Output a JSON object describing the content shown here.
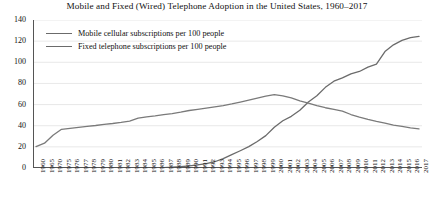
{
  "chart_data": {
    "type": "line",
    "title": "Mobile and Fixed (Wired) Telephone Adoption in the United States, 1960–2017",
    "xlabel": "",
    "ylabel": "",
    "ylim": [
      0,
      140
    ],
    "ytick_step": 20,
    "yticks": [
      0,
      20,
      40,
      60,
      80,
      100,
      120,
      140
    ],
    "grid": true,
    "legend_position": "top-left",
    "legend": [
      "Mobile cellular subscriptions per 100 people",
      "Fixed telephone subscriptions per 100 people"
    ],
    "categories": [
      "1960",
      "1965",
      "1970",
      "1975",
      "1976",
      "1977",
      "1978",
      "1979",
      "1980",
      "1981",
      "1982",
      "1983",
      "1984",
      "1985",
      "1986",
      "1987",
      "1988",
      "1989",
      "1990",
      "1991",
      "1992",
      "1993",
      "1994",
      "1995",
      "1996",
      "1997",
      "1998",
      "1999",
      "2000",
      "2001",
      "2002",
      "2003",
      "2004",
      "2005",
      "2006",
      "2007",
      "2008",
      "2009",
      "2010",
      "2011",
      "2012",
      "2013",
      "2014",
      "2015",
      "2016",
      "2017"
    ],
    "series": [
      {
        "name": "Mobile cellular subscriptions per 100 people",
        "color": "#6b6b6b",
        "values": [
          0,
          0,
          0,
          0,
          0,
          0,
          0,
          0,
          0,
          0,
          0,
          0,
          0,
          0,
          0.1,
          0.4,
          0.7,
          1.2,
          2.1,
          3.0,
          4.2,
          5.9,
          8.8,
          12.6,
          16.3,
          20.2,
          25.1,
          30.6,
          38.5,
          44.7,
          48.9,
          54.6,
          62.5,
          68.3,
          76.3,
          82.1,
          85.2,
          89.1,
          91.3,
          95.4,
          98.2,
          110.1,
          116.5,
          120.7,
          123.3,
          124.5
        ]
      },
      {
        "name": "Fixed telephone subscriptions per 100 people",
        "color": "#7a7a7a",
        "values": [
          20.3,
          23.5,
          31.0,
          36.6,
          37.5,
          38.4,
          39.3,
          40.2,
          41.3,
          42.1,
          43.1,
          44.4,
          47.1,
          48.4,
          49.3,
          50.4,
          51.5,
          52.8,
          54.4,
          55.5,
          56.6,
          57.8,
          59.1,
          60.6,
          62.3,
          64.1,
          66.0,
          67.9,
          69.4,
          68.2,
          66.4,
          63.6,
          61.3,
          59.0,
          57.0,
          55.4,
          53.8,
          50.6,
          48.2,
          46.0,
          44.1,
          42.4,
          40.6,
          39.3,
          38.0,
          37.0
        ]
      }
    ],
    "annotations": []
  }
}
